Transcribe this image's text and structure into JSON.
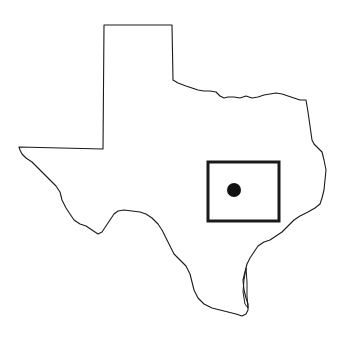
{
  "map": {
    "subject": "Texas state outline",
    "highlight_box": {
      "x": 208,
      "y": 162,
      "width": 71,
      "height": 59,
      "stroke_color": "#1a1a1a"
    },
    "location_marker": {
      "cx": 234,
      "cy": 190,
      "r": 7,
      "color": "#111111"
    }
  }
}
